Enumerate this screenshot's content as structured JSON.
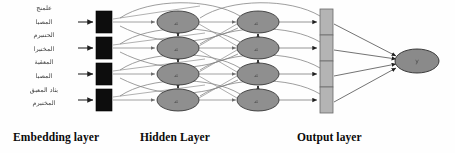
{
  "diagram": {
    "type": "neural-network-architecture",
    "background_color": "#fefefe"
  },
  "input_text": {
    "script": "arabic",
    "direction": "rtl",
    "legible": false,
    "lines": [
      "علمنج",
      "المصبا",
      "الحتنبرم",
      "المختبرا",
      "المعقبة",
      "المصبا",
      "بثاد المعبق",
      "المختبرم"
    ]
  },
  "captions": {
    "embedding": "Embedding layer",
    "hidden": "Hidden Layer",
    "output": "Output layer"
  },
  "layers": {
    "embedding": {
      "name": "embedding-layer",
      "shape": "rectangle",
      "fill": "#0d0d0d",
      "stroke": "#000000",
      "count": 4,
      "node_width": 16,
      "node_height": 22,
      "x": 96,
      "rows_y": [
        22,
        48,
        74,
        100
      ]
    },
    "hidden_forward": {
      "name": "hidden-layer-forward",
      "shape": "ellipse",
      "fill": "#8f8f8f",
      "stroke": "#2b2b2b",
      "count": 4,
      "rx": 21,
      "ry": 11,
      "x": 178,
      "rows_y": [
        22,
        48,
        74,
        100
      ],
      "flow_direction": "down",
      "glyph": "h"
    },
    "hidden_backward": {
      "name": "hidden-layer-backward",
      "shape": "ellipse",
      "fill": "#8f8f8f",
      "stroke": "#2b2b2b",
      "count": 4,
      "rx": 21,
      "ry": 11,
      "x": 258,
      "rows_y": [
        22,
        48,
        74,
        100
      ],
      "flow_direction": "up",
      "glyph": "h"
    },
    "output": {
      "name": "output-layer",
      "shape": "rectangle",
      "fill": "#b4b4b4",
      "stroke": "#6a6a6a",
      "count": 4,
      "node_width": 13,
      "node_height": 26,
      "x": 320,
      "rows_y": [
        22,
        48,
        74,
        100
      ]
    },
    "final_output": {
      "name": "final-output-node",
      "shape": "ellipse",
      "fill": "#8a8a8a",
      "stroke": "#2b2b2b",
      "rx": 22,
      "ry": 12,
      "cx": 417,
      "cy": 61,
      "glyph": "y"
    }
  },
  "edges": {
    "input_arrow_color": "#2a2a2a",
    "recurrent_arrow_color": "#3a3a3a",
    "skip_arc_color": "#7d7d7d",
    "converge_color": "#5a5a5a",
    "input_arrow_x_start": 78,
    "input_arrow_x_end": 94
  },
  "colors": {
    "embedding_fill": "#0d0d0d",
    "hidden_fill": "#8f8f8f",
    "output_fill": "#b4b4b4",
    "final_fill": "#8a8a8a",
    "text": "#0a0a0a"
  }
}
